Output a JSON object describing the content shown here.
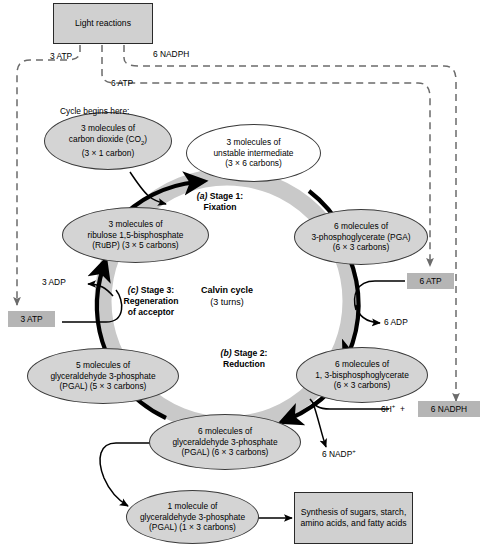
{
  "colors": {
    "oval_fill": "#d4d4d4",
    "oval_stroke": "#3a3a3a",
    "ring_fill": "#c9c9c9",
    "box_fill": "#d0d0d0",
    "tag_fill": "#b5b5b5",
    "arrow": "#000000",
    "dashed": "#6b6b6b"
  },
  "boxes": {
    "light_reactions": "Light reactions",
    "synthesis": "Synthesis of sugars, starch, amino acids, and fatty acids"
  },
  "tags": {
    "atp3_left": "3 ATP",
    "atp6_right": "6 ATP",
    "nadph6_right": "6 NADPH"
  },
  "edge_labels": {
    "atp3_top": "3 ATP",
    "atp6_top": "6 ATP",
    "nadph6_top": "6 NADPH",
    "adp3": "3 ADP",
    "adp6": "6 ADP",
    "nadp6": "6 NADP+",
    "h6": "6H+  +",
    "cycle_begins": "Cycle begins here:"
  },
  "center": {
    "line1": "Calvin cycle",
    "line2": "(3 turns)"
  },
  "stages": [
    {
      "id": "stage1",
      "marker": "(a)",
      "name": "Stage 1:",
      "sub": "Fixation"
    },
    {
      "id": "stage2",
      "marker": "(b)",
      "name": "Stage 2:",
      "sub": "Reduction"
    },
    {
      "id": "stage3",
      "marker": "(c)",
      "name": "Stage 3:",
      "sub": "Regeneration",
      "sub2": "of acceptor"
    }
  ],
  "ovals": {
    "co2": {
      "l1": "3 molecules of",
      "l2": "carbon dioxide (CO2)",
      "l3": "(3 × 1 carbon)"
    },
    "unstable": {
      "l1": "3 molecules of",
      "l2": "unstable intermediate",
      "l3": "(3 × 6 carbons)"
    },
    "pga": {
      "l1": "6 molecules of",
      "l2": "3-phosphoglycerate (PGA)",
      "l3": "(6 × 3 carbons)"
    },
    "bpg": {
      "l1": "6 molecules of",
      "l2": "1, 3-bisphosphoglycerate",
      "l3": "(6 × 3 carbons)"
    },
    "pgal6": {
      "l1": "6 molecules of",
      "l2": "glyceraldehyde 3-phosphate",
      "l3": "(PGAL) (6 × 3 carbons)"
    },
    "pgal5": {
      "l1": "5 molecules of",
      "l2": "glyceraldehyde 3-phosphate",
      "l3": "(PGAL) (5 × 3 carbons)"
    },
    "rubp": {
      "l1": "3 molecules of",
      "l2": "ribulose 1,5-bisphosphate",
      "l3": "(RuBP) (3 × 5 carbons)"
    },
    "pgal1": {
      "l1": "1 molecule of",
      "l2": "glyceraldehyde 3-phosphate",
      "l3": "(PGAL) (1 × 3 carbons)"
    }
  }
}
